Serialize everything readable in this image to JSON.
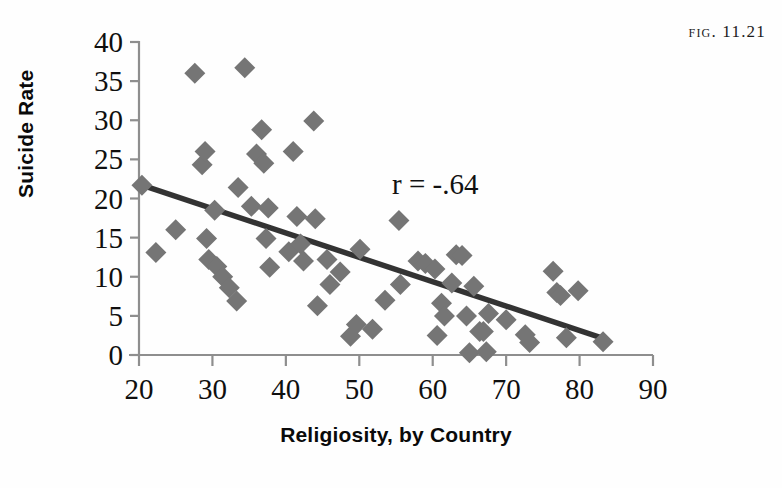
{
  "figure": {
    "label": "Fig. 11.21"
  },
  "annotation": {
    "correlation_text": "r = -.64"
  },
  "chart_data": {
    "type": "scatter",
    "title": "",
    "xlabel": "Religiosity, by Country",
    "ylabel": "Suicide Rate",
    "xlim": [
      20,
      90
    ],
    "ylim": [
      0,
      40
    ],
    "xticks": [
      20,
      30,
      40,
      50,
      60,
      70,
      80,
      90
    ],
    "yticks": [
      0,
      5,
      10,
      15,
      20,
      25,
      30,
      35,
      40
    ],
    "grid": false,
    "legend": null,
    "marker": "diamond",
    "marker_color": "#757575",
    "correlation": -0.64,
    "annotations": [
      {
        "text": "r = -.64",
        "x": 53,
        "y": 23.5
      }
    ],
    "trendline": {
      "type": "linear",
      "color": "#333333",
      "x_start": 20.4,
      "y_start": 21.7,
      "x_end": 83.0,
      "y_end": 2.2
    },
    "points": [
      {
        "x": 20.4,
        "y": 21.7
      },
      {
        "x": 22.3,
        "y": 13.1
      },
      {
        "x": 25.0,
        "y": 16.0
      },
      {
        "x": 27.6,
        "y": 36.0
      },
      {
        "x": 28.6,
        "y": 24.3
      },
      {
        "x": 29.0,
        "y": 26.0
      },
      {
        "x": 29.2,
        "y": 14.9
      },
      {
        "x": 29.5,
        "y": 12.2
      },
      {
        "x": 30.3,
        "y": 18.5
      },
      {
        "x": 30.6,
        "y": 11.3
      },
      {
        "x": 31.4,
        "y": 10.0
      },
      {
        "x": 32.3,
        "y": 8.6
      },
      {
        "x": 33.3,
        "y": 6.9
      },
      {
        "x": 33.5,
        "y": 21.4
      },
      {
        "x": 34.4,
        "y": 36.7
      },
      {
        "x": 35.3,
        "y": 19.0
      },
      {
        "x": 36.0,
        "y": 25.7
      },
      {
        "x": 36.7,
        "y": 28.8
      },
      {
        "x": 37.0,
        "y": 24.5
      },
      {
        "x": 37.3,
        "y": 14.9
      },
      {
        "x": 37.6,
        "y": 18.8
      },
      {
        "x": 37.8,
        "y": 11.2
      },
      {
        "x": 40.4,
        "y": 13.2
      },
      {
        "x": 41.0,
        "y": 26.0
      },
      {
        "x": 41.5,
        "y": 17.7
      },
      {
        "x": 42.0,
        "y": 14.2
      },
      {
        "x": 42.4,
        "y": 12.0
      },
      {
        "x": 43.8,
        "y": 29.9
      },
      {
        "x": 44.0,
        "y": 17.4
      },
      {
        "x": 44.3,
        "y": 6.3
      },
      {
        "x": 45.6,
        "y": 12.2
      },
      {
        "x": 46.0,
        "y": 9.0
      },
      {
        "x": 47.4,
        "y": 10.6
      },
      {
        "x": 48.8,
        "y": 2.4
      },
      {
        "x": 49.6,
        "y": 3.9
      },
      {
        "x": 50.1,
        "y": 13.5
      },
      {
        "x": 51.8,
        "y": 3.3
      },
      {
        "x": 53.5,
        "y": 7.0
      },
      {
        "x": 55.4,
        "y": 17.2
      },
      {
        "x": 55.6,
        "y": 9.0
      },
      {
        "x": 58.0,
        "y": 12.0
      },
      {
        "x": 59.0,
        "y": 11.7
      },
      {
        "x": 60.3,
        "y": 11.0
      },
      {
        "x": 60.6,
        "y": 2.5
      },
      {
        "x": 61.2,
        "y": 6.6
      },
      {
        "x": 61.6,
        "y": 5.0
      },
      {
        "x": 62.6,
        "y": 9.2
      },
      {
        "x": 63.2,
        "y": 12.8
      },
      {
        "x": 64.0,
        "y": 12.7
      },
      {
        "x": 64.6,
        "y": 5.0
      },
      {
        "x": 65.0,
        "y": 0.3
      },
      {
        "x": 65.6,
        "y": 8.8
      },
      {
        "x": 66.4,
        "y": 3.0
      },
      {
        "x": 66.9,
        "y": 3.0
      },
      {
        "x": 67.3,
        "y": 0.4
      },
      {
        "x": 67.6,
        "y": 5.3
      },
      {
        "x": 70.0,
        "y": 4.5
      },
      {
        "x": 72.6,
        "y": 2.6
      },
      {
        "x": 73.2,
        "y": 1.6
      },
      {
        "x": 76.4,
        "y": 10.7
      },
      {
        "x": 76.9,
        "y": 8.0
      },
      {
        "x": 77.4,
        "y": 7.6
      },
      {
        "x": 78.2,
        "y": 2.2
      },
      {
        "x": 79.8,
        "y": 8.2
      },
      {
        "x": 83.2,
        "y": 1.7
      }
    ]
  }
}
